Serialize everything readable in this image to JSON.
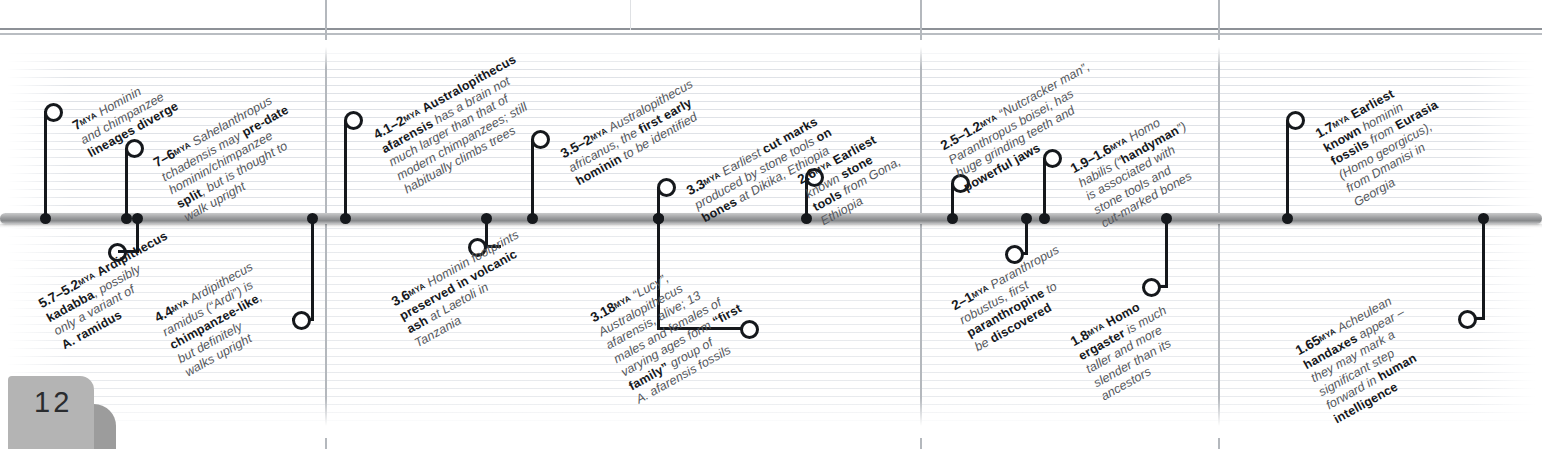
{
  "page": {
    "number": "12"
  },
  "timeline": {
    "title": "Human evolution timeline",
    "bar_color": "#9b9c9e",
    "accent_color": "#15181c",
    "events": [
      {
        "id": "7mya-divergence",
        "mya": "7",
        "mya_unit": "MYA",
        "side": "above",
        "text_plain": "Hominin and chimpanzee lineages diverge",
        "lines": [
          [
            {
              "t": "Hominin",
              "b": false
            }
          ],
          [
            {
              "t": "and chimpanzee",
              "b": false
            }
          ],
          [
            {
              "t": "lineages diverge",
              "b": true
            }
          ]
        ]
      },
      {
        "id": "7-6mya-sahelanthropus",
        "mya": "7–6",
        "mya_unit": "MYA",
        "side": "above",
        "text_plain": "Sahelanthropus tchadensis may pre-date hominin/chimpanzee split, but is thought to walk upright",
        "lines": [
          [
            {
              "t": "Sahelanthropus",
              "b": false,
              "i": true
            }
          ],
          [
            {
              "t": "tchadensis",
              "b": false,
              "i": true
            },
            {
              "t": " may ",
              "b": false
            },
            {
              "t": "pre-date",
              "b": true
            }
          ],
          [
            {
              "t": "hominin/chimpanzee",
              "b": false
            }
          ],
          [
            {
              "t": "split",
              "b": true
            },
            {
              "t": ", but is thought to",
              "b": false
            }
          ],
          [
            {
              "t": "walk upright",
              "b": false
            }
          ]
        ]
      },
      {
        "id": "5.7-5.2mya-ardipithecus-kadabba",
        "mya": "5.7–5.2",
        "mya_unit": "MYA",
        "side": "below",
        "text_plain": "Ardipithecus kadabba, possibly only a variant of A. ramidus",
        "lines": [
          [
            {
              "t": "Ardipithecus",
              "b": true,
              "i": true
            }
          ],
          [
            {
              "t": "kadabba",
              "b": true,
              "i": true
            },
            {
              "t": ", possibly",
              "b": false
            }
          ],
          [
            {
              "t": "only a variant of",
              "b": false
            }
          ],
          [
            {
              "t": "A. ramidus",
              "b": true,
              "i": true
            }
          ]
        ]
      },
      {
        "id": "4.4mya-ardipithecus-ramidus",
        "mya": "4.4",
        "mya_unit": "MYA",
        "side": "below",
        "text_plain": "Ardipithecus ramidus (“Ardi”) is chimpanzee-like, but definitely walks upright",
        "lines": [
          [
            {
              "t": "Ardipithecus",
              "b": false,
              "i": true
            }
          ],
          [
            {
              "t": "ramidus",
              "b": false,
              "i": true
            },
            {
              "t": " (“Ardi”) is",
              "b": false
            }
          ],
          [
            {
              "t": "chimpanzee-like",
              "b": true
            },
            {
              "t": ",",
              "b": false
            }
          ],
          [
            {
              "t": "but definitely",
              "b": false
            }
          ],
          [
            {
              "t": "walks upright",
              "b": false
            }
          ]
        ]
      },
      {
        "id": "4.1-2mya-afarensis",
        "mya": "4.1–2",
        "mya_unit": "MYA",
        "side": "above",
        "text_plain": "Australopithecus afarensis has a brain not much larger than that of modern chimpanzees; still habitually climbs trees",
        "lines": [
          [
            {
              "t": "Australopithecus",
              "b": true,
              "i": true
            }
          ],
          [
            {
              "t": "afarensis",
              "b": true,
              "i": true
            },
            {
              "t": " has a brain not",
              "b": false
            }
          ],
          [
            {
              "t": "much larger than that of",
              "b": false
            }
          ],
          [
            {
              "t": "modern chimpanzees; still",
              "b": false
            }
          ],
          [
            {
              "t": "habitually climbs trees",
              "b": false
            }
          ]
        ]
      },
      {
        "id": "3.6mya-laetoli-footprints",
        "mya": "3.6",
        "mya_unit": "MYA",
        "side": "below",
        "text_plain": "Hominin footprints preserved in volcanic ash at Laetoli in Tanzania",
        "lines": [
          [
            {
              "t": "Hominin footprints",
              "b": false
            }
          ],
          [
            {
              "t": "preserved in volcanic",
              "b": true
            }
          ],
          [
            {
              "t": "ash",
              "b": true
            },
            {
              "t": " at Laetoli in",
              "b": false
            }
          ],
          [
            {
              "t": "Tanzania",
              "b": false
            }
          ]
        ]
      },
      {
        "id": "3.5-2mya-africanus",
        "mya": "3.5–2",
        "mya_unit": "MYA",
        "side": "above",
        "text_plain": "Australopithecus africanus, the first early hominin to be identified",
        "lines": [
          [
            {
              "t": "Australopithecus",
              "b": false,
              "i": true
            }
          ],
          [
            {
              "t": "africanus",
              "b": false,
              "i": true
            },
            {
              "t": ", the ",
              "b": false
            },
            {
              "t": "first early",
              "b": true
            }
          ],
          [
            {
              "t": "hominin",
              "b": true
            },
            {
              "t": " to be identified",
              "b": false
            }
          ]
        ]
      },
      {
        "id": "3.3mya-dikika-cut-marks",
        "mya": "3.3",
        "mya_unit": "MYA",
        "side": "above",
        "text_plain": "Earliest cut marks produced by stone tools on bones at Dikika, Ethiopia",
        "lines": [
          [
            {
              "t": "Earliest ",
              "b": false
            },
            {
              "t": "cut marks",
              "b": true
            }
          ],
          [
            {
              "t": "produced by stone tools ",
              "b": false
            },
            {
              "t": "on",
              "b": true
            }
          ],
          [
            {
              "t": "bones",
              "b": true
            },
            {
              "t": " at Dikika, Ethiopia",
              "b": false
            }
          ]
        ]
      },
      {
        "id": "3.18mya-lucy",
        "mya": "3.18",
        "mya_unit": "MYA",
        "side": "below",
        "text_plain": "“Lucy”, Australopithecus afarensis, alive; 13 males and females of varying ages form “first family” group of A. afarensis fossils",
        "lines": [
          [
            {
              "t": "“Lucy”,",
              "b": false
            }
          ],
          [
            {
              "t": "Australopithecus",
              "b": false,
              "i": true
            }
          ],
          [
            {
              "t": "afarensis",
              "b": false,
              "i": true
            },
            {
              "t": ", alive; 13",
              "b": false
            }
          ],
          [
            {
              "t": "males and females of",
              "b": false
            }
          ],
          [
            {
              "t": "varying ages form ",
              "b": false
            },
            {
              "t": "“first",
              "b": true
            }
          ],
          [
            {
              "t": "family”",
              "b": true
            },
            {
              "t": " group of",
              "b": false
            }
          ],
          [
            {
              "t": "A. afarensis",
              "b": false,
              "i": true
            },
            {
              "t": " fossils",
              "b": false
            }
          ]
        ]
      },
      {
        "id": "2.6mya-gona-tools",
        "mya": "2.6",
        "mya_unit": "MYA",
        "side": "above",
        "text_plain": "Earliest known stone tools from Gona, Ethiopia",
        "lines": [
          [
            {
              "t": "Earliest",
              "b": true
            }
          ],
          [
            {
              "t": "known ",
              "b": false
            },
            {
              "t": "stone",
              "b": true
            }
          ],
          [
            {
              "t": "tools",
              "b": true
            },
            {
              "t": " from Gona,",
              "b": false
            }
          ],
          [
            {
              "t": "Ethiopia",
              "b": false
            }
          ]
        ]
      },
      {
        "id": "2.5-1.2mya-boisei",
        "mya": "2.5–1.2",
        "mya_unit": "MYA",
        "side": "above",
        "text_plain": "“Nutcracker man”, Paranthropus boisei, has huge grinding teeth and powerful jaws",
        "lines": [
          [
            {
              "t": "“Nutcracker man”,",
              "b": false
            }
          ],
          [
            {
              "t": "Paranthropus boisei",
              "b": false,
              "i": true
            },
            {
              "t": ", has",
              "b": false
            }
          ],
          [
            {
              "t": "huge grinding teeth and",
              "b": false
            }
          ],
          [
            {
              "t": "powerful jaws",
              "b": true
            }
          ]
        ]
      },
      {
        "id": "2-1mya-robustus",
        "mya": "2–1",
        "mya_unit": "MYA",
        "side": "below",
        "text_plain": "Paranthropus robustus, first paranthropine to be discovered",
        "lines": [
          [
            {
              "t": "Paranthropus",
              "b": false,
              "i": true
            }
          ],
          [
            {
              "t": "robustus",
              "b": false,
              "i": true
            },
            {
              "t": ", first",
              "b": false
            }
          ],
          [
            {
              "t": "paranthropine",
              "b": true
            },
            {
              "t": " to",
              "b": false
            }
          ],
          [
            {
              "t": "be ",
              "b": false
            },
            {
              "t": "discovered",
              "b": true
            }
          ]
        ]
      },
      {
        "id": "1.9-1.6mya-habilis",
        "mya": "1.9–1.6",
        "mya_unit": "MYA",
        "side": "above",
        "text_plain": "Homo habilis (“handyman”) is associated with stone tools and cut-marked bones",
        "lines": [
          [
            {
              "t": "Homo",
              "b": false,
              "i": true
            }
          ],
          [
            {
              "t": "habilis",
              "b": false,
              "i": true
            },
            {
              "t": " (“",
              "b": false
            },
            {
              "t": "handyman",
              "b": true
            },
            {
              "t": "”)",
              "b": false
            }
          ],
          [
            {
              "t": "is associated with",
              "b": false
            }
          ],
          [
            {
              "t": "stone tools and",
              "b": false
            }
          ],
          [
            {
              "t": "cut-marked bones",
              "b": false
            }
          ]
        ]
      },
      {
        "id": "1.8mya-ergaster",
        "mya": "1.8",
        "mya_unit": "MYA",
        "side": "below",
        "text_plain": "Homo ergaster is much taller and more slender than its ancestors",
        "lines": [
          [
            {
              "t": "Homo",
              "b": true,
              "i": true
            }
          ],
          [
            {
              "t": "ergaster",
              "b": true,
              "i": true
            },
            {
              "t": " is much",
              "b": false
            }
          ],
          [
            {
              "t": "taller and more",
              "b": false
            }
          ],
          [
            {
              "t": "slender than its",
              "b": false
            }
          ],
          [
            {
              "t": "ancestors",
              "b": false
            }
          ]
        ]
      },
      {
        "id": "1.7mya-dmanisi",
        "mya": "1.7",
        "mya_unit": "MYA",
        "side": "above",
        "text_plain": "Earliest known hominin fossils from Eurasia (Homo georgicus), from Dmanisi in Georgia",
        "lines": [
          [
            {
              "t": "Earliest",
              "b": true
            }
          ],
          [
            {
              "t": "known",
              "b": true
            },
            {
              "t": " hominin",
              "b": false
            }
          ],
          [
            {
              "t": "fossils",
              "b": true
            },
            {
              "t": " from ",
              "b": false
            },
            {
              "t": "Eurasia",
              "b": true
            }
          ],
          [
            {
              "t": "(Homo georgicus)",
              "b": false,
              "i": true
            },
            {
              "t": ",",
              "b": false
            }
          ],
          [
            {
              "t": "from Dmanisi in",
              "b": false
            }
          ],
          [
            {
              "t": "Georgia",
              "b": false
            }
          ]
        ]
      },
      {
        "id": "1.65mya-acheulean",
        "mya": "1.65",
        "mya_unit": "MYA",
        "side": "below",
        "text_plain": "Acheulean handaxes appear – they may mark a significant step forward in human intelligence",
        "lines": [
          [
            {
              "t": "Acheulean",
              "b": false
            }
          ],
          [
            {
              "t": "handaxes",
              "b": true
            },
            {
              "t": " appear –",
              "b": false
            }
          ],
          [
            {
              "t": "they may mark a",
              "b": false
            }
          ],
          [
            {
              "t": "significant step",
              "b": false
            }
          ],
          [
            {
              "t": "forward in ",
              "b": false
            },
            {
              "t": "human",
              "b": true
            }
          ],
          [
            {
              "t": "intelligence",
              "b": true
            }
          ]
        ]
      }
    ]
  }
}
